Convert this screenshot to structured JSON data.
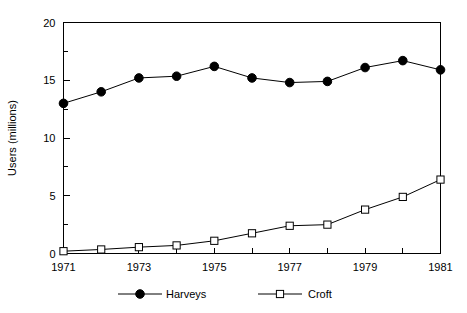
{
  "chart_data": {
    "type": "line",
    "title": "",
    "subtitle": "",
    "xlabel": "",
    "ylabel": "Users (millions)",
    "x": [
      1971,
      1972,
      1973,
      1974,
      1975,
      1976,
      1977,
      1978,
      1979,
      1980,
      1981
    ],
    "xlim": [
      1971,
      1981
    ],
    "ylim": [
      0,
      20
    ],
    "grid": false,
    "legend_position": "bottom",
    "y_ticks": [
      0,
      5,
      10,
      15,
      20
    ],
    "y_tick_labels": [
      "0",
      "5",
      "10",
      "15",
      "20"
    ],
    "y_minor_tick_step": 2.5,
    "x_ticks": [
      1971,
      1972,
      1973,
      1974,
      1975,
      1976,
      1977,
      1978,
      1979,
      1980,
      1981
    ],
    "x_tick_labels": [
      "1971",
      "",
      "1973",
      "",
      "1975",
      "",
      "1977",
      "",
      "1979",
      "",
      "1981"
    ],
    "x_labeled_ticks": [
      "1971",
      "1973",
      "1975",
      "1977",
      "1979",
      "1981"
    ],
    "series": [
      {
        "name": "Harveys",
        "marker": "filled-circle",
        "color": "#000000",
        "values": [
          13.0,
          14.0,
          15.2,
          15.35,
          16.2,
          15.2,
          14.8,
          14.9,
          16.1,
          16.7,
          15.9
        ]
      },
      {
        "name": "Croft",
        "marker": "open-square",
        "color": "#000000",
        "values": [
          0.2,
          0.35,
          0.55,
          0.7,
          1.1,
          1.75,
          2.4,
          2.5,
          3.8,
          4.9,
          6.4
        ]
      }
    ]
  },
  "legend": {
    "items": [
      {
        "label": "Harveys",
        "marker": "filled-circle"
      },
      {
        "label": "Croft",
        "marker": "open-square"
      }
    ]
  },
  "axis": {
    "y_title": "Users (millions)"
  },
  "colors": {
    "background": "#ffffff",
    "foreground": "#000000",
    "series_harveys": "#000000",
    "series_croft": "#000000"
  }
}
